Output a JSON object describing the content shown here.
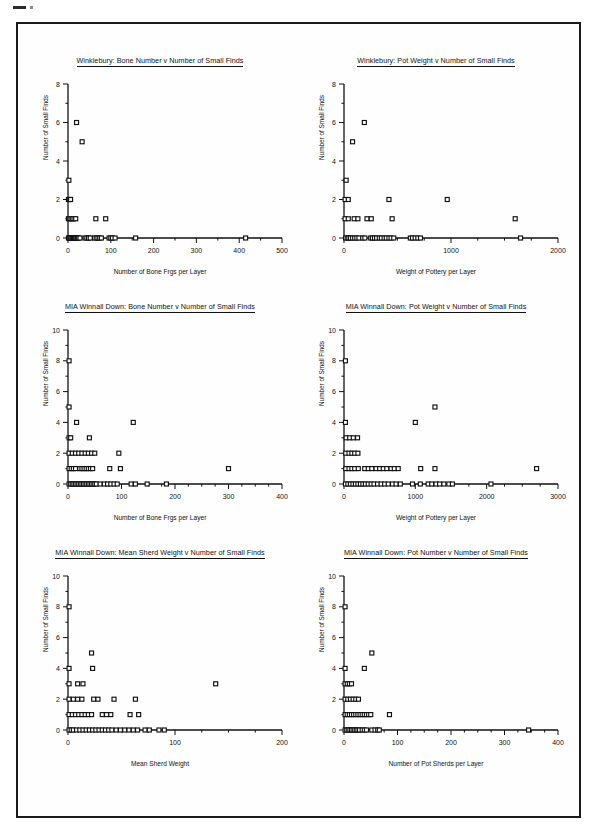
{
  "document": {
    "page_kind": "scanned-figure-page",
    "border_color": "#1a1a1a",
    "background": "#ffffff",
    "marker_color": "#2b2b2b"
  },
  "shared": {
    "y_axis_label": "Number of Small Finds",
    "marker_style": "open-square",
    "marker_color": "#111111",
    "axis_color": "#111111"
  },
  "chart_data": [
    {
      "id": "winklebury-bone-number",
      "type": "scatter",
      "title": "Winklebury: Bone Number v Number of Small Finds",
      "xlabel": "Number of Bone Frgs per Layer",
      "ylabel": "Number of Small Finds",
      "xlim": [
        0,
        500
      ],
      "ylim": [
        0,
        8
      ],
      "xticks": [
        0,
        100,
        200,
        300,
        400,
        500
      ],
      "yticks": [
        0,
        2,
        4,
        6,
        8
      ],
      "xminor": 50,
      "yminor": 1,
      "grid": false,
      "legend": "none",
      "points": [
        [
          20,
          6
        ],
        [
          33,
          5
        ],
        [
          2,
          3
        ],
        [
          1,
          2
        ],
        [
          4,
          2
        ],
        [
          6,
          2
        ],
        [
          1,
          1
        ],
        [
          4,
          1
        ],
        [
          7,
          1
        ],
        [
          10,
          1
        ],
        [
          14,
          1
        ],
        [
          18,
          1
        ],
        [
          65,
          1
        ],
        [
          88,
          1
        ],
        [
          1,
          0
        ],
        [
          3,
          0
        ],
        [
          5,
          0
        ],
        [
          7,
          0
        ],
        [
          9,
          0
        ],
        [
          11,
          0
        ],
        [
          13,
          0
        ],
        [
          15,
          0
        ],
        [
          17,
          0
        ],
        [
          19,
          0
        ],
        [
          22,
          0
        ],
        [
          25,
          0
        ],
        [
          28,
          0
        ],
        [
          40,
          0
        ],
        [
          44,
          0
        ],
        [
          48,
          0
        ],
        [
          52,
          0
        ],
        [
          62,
          0
        ],
        [
          66,
          0
        ],
        [
          70,
          0
        ],
        [
          74,
          0
        ],
        [
          78,
          0
        ],
        [
          96,
          0
        ],
        [
          100,
          0
        ],
        [
          104,
          0
        ],
        [
          110,
          0
        ],
        [
          158,
          0
        ],
        [
          415,
          0
        ]
      ]
    },
    {
      "id": "winklebury-pot-weight",
      "type": "scatter",
      "title": "Winklebury: Pot Weight v Number of Small Finds",
      "xlabel": "Weight of Pottery per Layer",
      "ylabel": "Number of Small Finds",
      "xlim": [
        0,
        2000
      ],
      "ylim": [
        0,
        8
      ],
      "xticks": [
        0,
        1000,
        2000
      ],
      "yticks": [
        0,
        2,
        4,
        6,
        8
      ],
      "xminor": 250,
      "yminor": 1,
      "grid": false,
      "legend": "none",
      "points": [
        [
          190,
          6
        ],
        [
          80,
          5
        ],
        [
          20,
          3
        ],
        [
          10,
          2
        ],
        [
          40,
          2
        ],
        [
          420,
          2
        ],
        [
          965,
          2
        ],
        [
          10,
          1
        ],
        [
          40,
          1
        ],
        [
          95,
          1
        ],
        [
          130,
          1
        ],
        [
          215,
          1
        ],
        [
          255,
          1
        ],
        [
          450,
          1
        ],
        [
          1600,
          1
        ],
        [
          15,
          0
        ],
        [
          30,
          0
        ],
        [
          45,
          0
        ],
        [
          60,
          0
        ],
        [
          80,
          0
        ],
        [
          100,
          0
        ],
        [
          120,
          0
        ],
        [
          140,
          0
        ],
        [
          175,
          0
        ],
        [
          195,
          0
        ],
        [
          250,
          0
        ],
        [
          265,
          0
        ],
        [
          285,
          0
        ],
        [
          305,
          0
        ],
        [
          330,
          0
        ],
        [
          350,
          0
        ],
        [
          375,
          0
        ],
        [
          395,
          0
        ],
        [
          420,
          0
        ],
        [
          440,
          0
        ],
        [
          465,
          0
        ],
        [
          620,
          0
        ],
        [
          640,
          0
        ],
        [
          665,
          0
        ],
        [
          690,
          0
        ],
        [
          715,
          0
        ],
        [
          1650,
          0
        ]
      ]
    },
    {
      "id": "mia-winnall-bone-number",
      "type": "scatter",
      "title": "MIA Winnall Down: Bone Number v Number of Small Finds",
      "xlabel": "Number of Bone Frgs per Layer",
      "ylabel": "Number of Small Finds",
      "xlim": [
        0,
        400
      ],
      "ylim": [
        0,
        10
      ],
      "xticks": [
        0,
        100,
        200,
        300,
        400
      ],
      "yticks": [
        0,
        2,
        4,
        6,
        8,
        10
      ],
      "xminor": 25,
      "yminor": 1,
      "grid": false,
      "legend": "none",
      "points": [
        [
          2,
          8
        ],
        [
          2,
          5
        ],
        [
          16,
          4
        ],
        [
          122,
          4
        ],
        [
          2,
          3
        ],
        [
          5,
          3
        ],
        [
          40,
          3
        ],
        [
          2,
          2
        ],
        [
          8,
          2
        ],
        [
          14,
          2
        ],
        [
          20,
          2
        ],
        [
          26,
          2
        ],
        [
          32,
          2
        ],
        [
          38,
          2
        ],
        [
          44,
          2
        ],
        [
          50,
          2
        ],
        [
          95,
          2
        ],
        [
          2,
          1
        ],
        [
          6,
          1
        ],
        [
          10,
          1
        ],
        [
          14,
          1
        ],
        [
          22,
          1
        ],
        [
          26,
          1
        ],
        [
          30,
          1
        ],
        [
          34,
          1
        ],
        [
          38,
          1
        ],
        [
          42,
          1
        ],
        [
          46,
          1
        ],
        [
          78,
          1
        ],
        [
          98,
          1
        ],
        [
          300,
          1
        ],
        [
          2,
          0
        ],
        [
          5,
          0
        ],
        [
          8,
          0
        ],
        [
          11,
          0
        ],
        [
          14,
          0
        ],
        [
          17,
          0
        ],
        [
          20,
          0
        ],
        [
          23,
          0
        ],
        [
          26,
          0
        ],
        [
          29,
          0
        ],
        [
          32,
          0
        ],
        [
          35,
          0
        ],
        [
          38,
          0
        ],
        [
          41,
          0
        ],
        [
          44,
          0
        ],
        [
          47,
          0
        ],
        [
          50,
          0
        ],
        [
          53,
          0
        ],
        [
          60,
          0
        ],
        [
          68,
          0
        ],
        [
          74,
          0
        ],
        [
          80,
          0
        ],
        [
          86,
          0
        ],
        [
          92,
          0
        ],
        [
          118,
          0
        ],
        [
          126,
          0
        ],
        [
          148,
          0
        ],
        [
          184,
          0
        ]
      ]
    },
    {
      "id": "mia-winnall-pot-weight",
      "type": "scatter",
      "title": "MIA Winnall Down: Pot Weight v Number of Small Finds",
      "xlabel": "Weight of Pottery per Layer",
      "ylabel": "Number of Small Finds",
      "xlim": [
        0,
        3000
      ],
      "ylim": [
        0,
        10
      ],
      "xticks": [
        0,
        1000,
        2000,
        3000
      ],
      "yticks": [
        0,
        2,
        4,
        6,
        8,
        10
      ],
      "xminor": 250,
      "yminor": 1,
      "grid": false,
      "legend": "none",
      "points": [
        [
          20,
          8
        ],
        [
          20,
          4
        ],
        [
          1000,
          4
        ],
        [
          1275,
          5
        ],
        [
          30,
          3
        ],
        [
          80,
          3
        ],
        [
          130,
          3
        ],
        [
          190,
          3
        ],
        [
          25,
          2
        ],
        [
          70,
          2
        ],
        [
          110,
          2
        ],
        [
          150,
          2
        ],
        [
          195,
          2
        ],
        [
          25,
          1
        ],
        [
          70,
          1
        ],
        [
          110,
          1
        ],
        [
          150,
          1
        ],
        [
          200,
          1
        ],
        [
          290,
          1
        ],
        [
          340,
          1
        ],
        [
          390,
          1
        ],
        [
          450,
          1
        ],
        [
          500,
          1
        ],
        [
          550,
          1
        ],
        [
          600,
          1
        ],
        [
          660,
          1
        ],
        [
          705,
          1
        ],
        [
          760,
          1
        ],
        [
          1075,
          1
        ],
        [
          1275,
          1
        ],
        [
          2700,
          1
        ],
        [
          20,
          0
        ],
        [
          55,
          0
        ],
        [
          90,
          0
        ],
        [
          125,
          0
        ],
        [
          160,
          0
        ],
        [
          195,
          0
        ],
        [
          230,
          0
        ],
        [
          265,
          0
        ],
        [
          300,
          0
        ],
        [
          340,
          0
        ],
        [
          380,
          0
        ],
        [
          420,
          0
        ],
        [
          470,
          0
        ],
        [
          520,
          0
        ],
        [
          570,
          0
        ],
        [
          620,
          0
        ],
        [
          680,
          0
        ],
        [
          730,
          0
        ],
        [
          790,
          0
        ],
        [
          960,
          0
        ],
        [
          1070,
          0
        ],
        [
          1180,
          0
        ],
        [
          1230,
          0
        ],
        [
          1290,
          0
        ],
        [
          1340,
          0
        ],
        [
          1400,
          0
        ],
        [
          1470,
          0
        ],
        [
          1520,
          0
        ],
        [
          2060,
          0
        ]
      ]
    },
    {
      "id": "mia-winnall-mean-sherd-weight",
      "type": "scatter",
      "title": "MIA Winnall Down: Mean Sherd Weight v Number of Small Finds",
      "xlabel": "Mean Sherd Weight",
      "ylabel": "Number of Small Finds",
      "xlim": [
        0,
        200
      ],
      "ylim": [
        0,
        10
      ],
      "xticks": [
        0,
        100,
        200
      ],
      "yticks": [
        0,
        2,
        4,
        6,
        8,
        10
      ],
      "xminor": 25,
      "yminor": 1,
      "grid": false,
      "legend": "none",
      "points": [
        [
          1,
          8
        ],
        [
          22,
          5
        ],
        [
          1,
          4
        ],
        [
          23,
          4
        ],
        [
          1,
          3
        ],
        [
          9,
          3
        ],
        [
          14,
          3
        ],
        [
          138,
          3
        ],
        [
          1,
          2
        ],
        [
          5,
          2
        ],
        [
          9,
          2
        ],
        [
          13,
          2
        ],
        [
          24,
          2
        ],
        [
          28,
          2
        ],
        [
          43,
          2
        ],
        [
          63,
          2
        ],
        [
          1,
          1
        ],
        [
          4,
          1
        ],
        [
          7,
          1
        ],
        [
          10,
          1
        ],
        [
          13,
          1
        ],
        [
          16,
          1
        ],
        [
          19,
          1
        ],
        [
          22,
          1
        ],
        [
          32,
          1
        ],
        [
          36,
          1
        ],
        [
          40,
          1
        ],
        [
          58,
          1
        ],
        [
          66,
          1
        ],
        [
          1,
          0
        ],
        [
          3,
          0
        ],
        [
          5,
          0
        ],
        [
          8,
          0
        ],
        [
          11,
          0
        ],
        [
          14,
          0
        ],
        [
          17,
          0
        ],
        [
          20,
          0
        ],
        [
          23,
          0
        ],
        [
          26,
          0
        ],
        [
          29,
          0
        ],
        [
          32,
          0
        ],
        [
          35,
          0
        ],
        [
          38,
          0
        ],
        [
          41,
          0
        ],
        [
          45,
          0
        ],
        [
          49,
          0
        ],
        [
          53,
          0
        ],
        [
          57,
          0
        ],
        [
          61,
          0
        ],
        [
          65,
          0
        ],
        [
          72,
          0
        ],
        [
          76,
          0
        ],
        [
          85,
          0
        ],
        [
          90,
          0
        ]
      ]
    },
    {
      "id": "mia-winnall-pot-number",
      "type": "scatter",
      "title": "MIA Winnall Down: Pot Number v Number of Small Finds",
      "xlabel": "Number of Pot Sherds per Layer",
      "ylabel": "Number of Small Finds",
      "xlim": [
        0,
        400
      ],
      "ylim": [
        0,
        10
      ],
      "xticks": [
        0,
        100,
        200,
        300,
        400
      ],
      "yticks": [
        0,
        2,
        4,
        6,
        8,
        10
      ],
      "xminor": 25,
      "yminor": 1,
      "grid": false,
      "legend": "none",
      "points": [
        [
          2,
          8
        ],
        [
          52,
          5
        ],
        [
          2,
          4
        ],
        [
          38,
          4
        ],
        [
          2,
          3
        ],
        [
          6,
          3
        ],
        [
          10,
          3
        ],
        [
          14,
          3
        ],
        [
          2,
          2
        ],
        [
          7,
          2
        ],
        [
          12,
          2
        ],
        [
          17,
          2
        ],
        [
          22,
          2
        ],
        [
          27,
          2
        ],
        [
          2,
          1
        ],
        [
          6,
          1
        ],
        [
          10,
          1
        ],
        [
          14,
          1
        ],
        [
          18,
          1
        ],
        [
          22,
          1
        ],
        [
          26,
          1
        ],
        [
          30,
          1
        ],
        [
          34,
          1
        ],
        [
          38,
          1
        ],
        [
          42,
          1
        ],
        [
          46,
          1
        ],
        [
          50,
          1
        ],
        [
          85,
          1
        ],
        [
          2,
          0
        ],
        [
          5,
          0
        ],
        [
          8,
          0
        ],
        [
          11,
          0
        ],
        [
          14,
          0
        ],
        [
          17,
          0
        ],
        [
          20,
          0
        ],
        [
          23,
          0
        ],
        [
          26,
          0
        ],
        [
          29,
          0
        ],
        [
          34,
          0
        ],
        [
          38,
          0
        ],
        [
          42,
          0
        ],
        [
          52,
          0
        ],
        [
          58,
          0
        ],
        [
          63,
          0
        ],
        [
          66,
          0
        ],
        [
          345,
          0
        ]
      ]
    }
  ]
}
